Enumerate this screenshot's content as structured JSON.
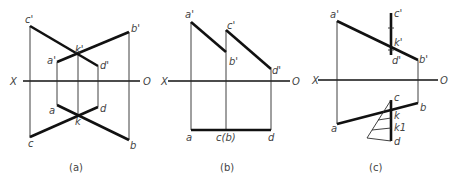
{
  "panels": [
    {
      "id": "a",
      "caption": "(a)",
      "axis": {
        "left": "X",
        "right": "O"
      },
      "labels": {
        "c1": "c'",
        "b1": "b'",
        "k1": "k'",
        "a1": "a'",
        "d1": "d'",
        "a": "a",
        "d": "d",
        "k": "k",
        "c": "c",
        "b": "b"
      }
    },
    {
      "id": "b",
      "caption": "(b)",
      "axis": {
        "left": "X",
        "right": "O"
      },
      "labels": {
        "a1": "a'",
        "c1": "c'",
        "b1": "b'",
        "d1": "d'",
        "a": "a",
        "cb": "c(b)",
        "d": "d"
      }
    },
    {
      "id": "c",
      "caption": "(c)",
      "axis": {
        "left": "X",
        "right": "O"
      },
      "labels": {
        "a1": "a'",
        "c1": "c'",
        "k1": "k'",
        "d1": "d'",
        "b1": "b'",
        "c": "c",
        "b": "b",
        "a": "a",
        "k": "k",
        "kk1": "k1",
        "d": "d"
      }
    }
  ]
}
